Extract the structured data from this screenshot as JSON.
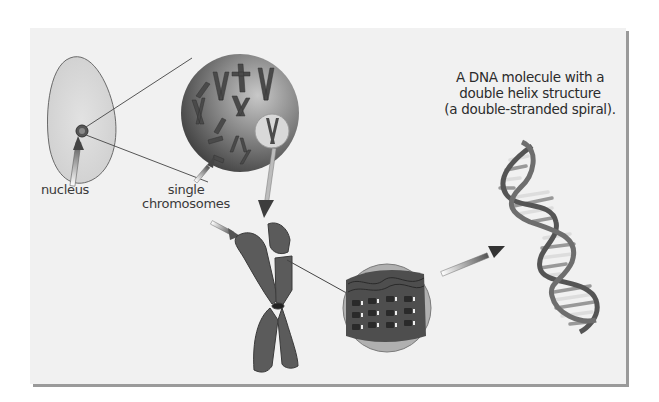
{
  "diagram": {
    "title_lines": [
      "A DNA molecule with a",
      "double helix structure",
      "(a double-stranded spiral)."
    ],
    "labels": {
      "nucleus": "nucleus",
      "single_chromosomes_line1": "single",
      "single_chromosomes_line2": "chromosomes"
    },
    "stages": [
      {
        "id": "cell",
        "description": "cell with nucleus"
      },
      {
        "id": "nucleus-magnified",
        "description": "magnified nucleus containing chromosomes"
      },
      {
        "id": "chromosome",
        "description": "single duplicated chromosome"
      },
      {
        "id": "chromatin",
        "description": "magnified chromatin fiber with nucleosomes"
      },
      {
        "id": "dna-helix",
        "description": "DNA double helix"
      }
    ],
    "colors": {
      "panel_bg": "#f1f1f1",
      "panel_shadow": "#9a9a9a",
      "cell_fill": "#d8d8d8",
      "sphere_dark": "#4a4a4a",
      "chromosome": "#5a5a5a",
      "text": "#2b2b2b"
    }
  }
}
